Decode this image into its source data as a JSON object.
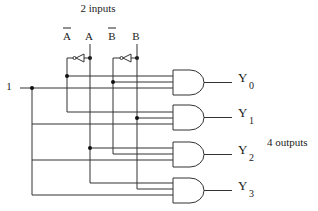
{
  "title": "2 inputs",
  "outputs_label": "4 outputs",
  "enable_label": "1",
  "inputs": [
    {
      "id": "A_bar",
      "label": "A",
      "overbar": true
    },
    {
      "id": "A",
      "label": "A",
      "overbar": false
    },
    {
      "id": "B_bar",
      "label": "B",
      "overbar": true
    },
    {
      "id": "B",
      "label": "B",
      "overbar": false
    }
  ],
  "outputs": [
    {
      "label": "Y",
      "sub": "0",
      "inputs": [
        "A_bar",
        "B_bar",
        "1"
      ]
    },
    {
      "label": "Y",
      "sub": "1",
      "inputs": [
        "A_bar",
        "B",
        "1"
      ]
    },
    {
      "label": "Y",
      "sub": "2",
      "inputs": [
        "A",
        "B_bar",
        "1"
      ]
    },
    {
      "label": "Y",
      "sub": "3",
      "inputs": [
        "A",
        "B",
        "1"
      ]
    }
  ],
  "colors": {
    "line": "#333333",
    "background": "#ffffff"
  }
}
